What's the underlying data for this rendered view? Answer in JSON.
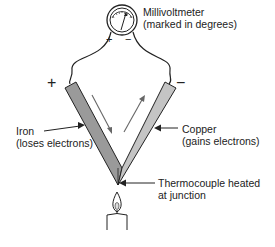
{
  "diagram": {
    "meter": {
      "line1": "Millivoltmeter",
      "line2": "(marked in degrees)",
      "plus": "+",
      "minus": "−"
    },
    "left_terminal": "+",
    "right_terminal": "−",
    "iron": {
      "line1": "Iron",
      "line2": "(loses electrons)",
      "color": "#9a9a9a"
    },
    "copper": {
      "line1": "Copper",
      "line2": "(gains electrons)",
      "color": "#c4c4c4"
    },
    "junction": {
      "line1": "Thermocouple heated",
      "line2": "at junction"
    }
  }
}
